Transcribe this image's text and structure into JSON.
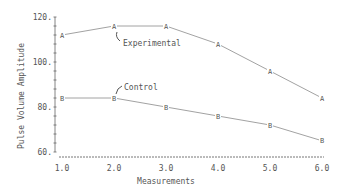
{
  "chart_data": {
    "type": "line",
    "title": "",
    "xlabel": "Measurements",
    "ylabel": "Pulse Volume Amplitude",
    "x": [
      1.0,
      2.0,
      3.0,
      4.0,
      5.0,
      6.0
    ],
    "x_tick_labels": [
      "1.0",
      "2.0",
      "3.0",
      "4.0",
      "5.0",
      "6.0"
    ],
    "y_tick_labels": [
      "120.",
      "100.",
      "80.",
      "60."
    ],
    "y_ticks": [
      120,
      100,
      80,
      60
    ],
    "xlim": [
      1.0,
      6.0
    ],
    "ylim": [
      60,
      120
    ],
    "grid": false,
    "series": [
      {
        "name": "Experimental",
        "marker": "A",
        "values": [
          112,
          116,
          116,
          108,
          96,
          84
        ]
      },
      {
        "name": "Control",
        "marker": "B",
        "values": [
          84,
          84,
          80,
          76,
          72,
          65
        ]
      }
    ],
    "annotations": [
      {
        "text": "Experimental",
        "points_to_x": 2.0
      },
      {
        "text": "Control",
        "points_to_x": 2.0
      }
    ]
  },
  "colors": {
    "line": "#8a8a8a",
    "text": "#555555",
    "background": "#ffffff"
  }
}
